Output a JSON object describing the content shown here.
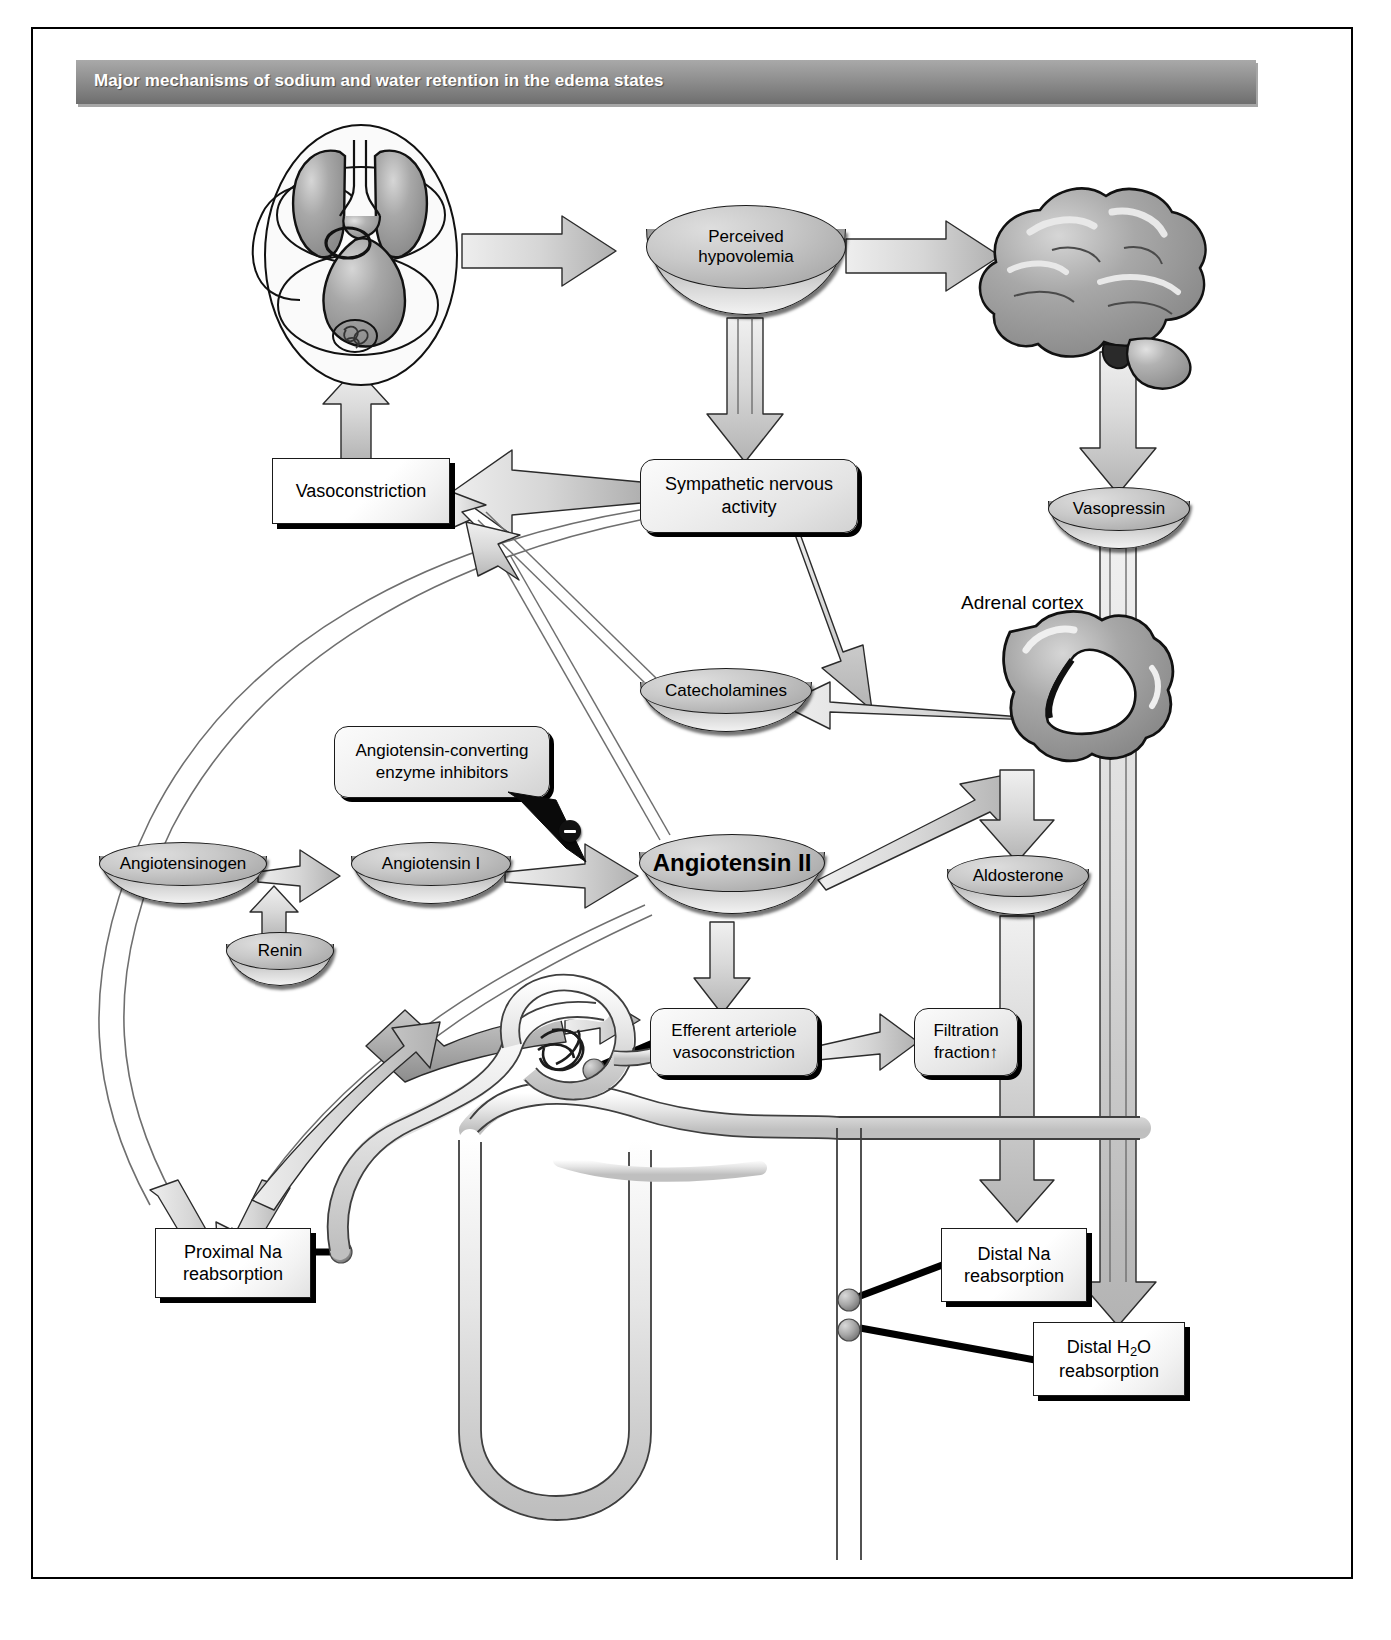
{
  "title": "Major mechanisms of sodium and water retention in the edema states",
  "diagram": {
    "type": "flowchart",
    "nodes": {
      "perceived_hypovolemia": {
        "line1": "Perceived",
        "line2": "hypovolemia",
        "shape": "disc"
      },
      "vasoconstriction": {
        "label": "Vasoconstriction",
        "shape": "rect"
      },
      "sympathetic_nervous_activity": {
        "line1": "Sympathetic nervous",
        "line2": "activity",
        "shape": "rounded-rect"
      },
      "vasopressin": {
        "label": "Vasopressin",
        "shape": "disc"
      },
      "adrenal_cortex": {
        "label": "Adrenal cortex",
        "shape": "plain-text"
      },
      "catecholamines": {
        "label": "Catecholamines",
        "shape": "disc"
      },
      "ace_inhibitors": {
        "line1": "Angiotensin-converting",
        "line2": "enzyme inhibitors",
        "shape": "callout"
      },
      "angiotensinogen": {
        "label": "Angiotensinogen",
        "shape": "disc"
      },
      "angiotensin_i": {
        "label": "Angiotensin I",
        "shape": "disc"
      },
      "angiotensin_ii": {
        "label": "Angiotensin II",
        "shape": "disc",
        "emphasis": "bold"
      },
      "aldosterone": {
        "label": "Aldosterone",
        "shape": "disc"
      },
      "renin": {
        "label": "Renin",
        "shape": "disc"
      },
      "efferent_arteriole_vasoconstriction": {
        "line1": "Efferent arteriole",
        "line2": "vasoconstriction",
        "shape": "rounded-rect"
      },
      "filtration_fraction": {
        "line1": "Filtration",
        "line2": "fraction↑",
        "shape": "rounded-rect"
      },
      "proximal_na_reabsorption": {
        "line1": "Proximal Na",
        "line2": "reabsorption",
        "shape": "rect"
      },
      "distal_na_reabsorption": {
        "line1": "Distal Na",
        "line2": "reabsorption",
        "shape": "rect"
      },
      "distal_h2o_reabsorption": {
        "line1_pre": "Distal H",
        "line1_sub": "2",
        "line1_post": "O",
        "line2": "reabsorption",
        "shape": "rect"
      }
    },
    "illustrations": {
      "heart_lungs": "heart-and-lungs-circulation-illustration",
      "brain": "brain-illustration",
      "adrenal_gland": "adrenal-cortex-illustration",
      "nephron": "nephron-tubule-and-glomerulus-illustration"
    },
    "symbols": {
      "inhibition": "⊖",
      "inhibition_name": "minus-inhibition-symbol"
    },
    "edges": [
      {
        "from": "heart_lungs",
        "to": "perceived_hypovolemia",
        "style": "block-arrow"
      },
      {
        "from": "perceived_hypovolemia",
        "to": "brain",
        "style": "block-arrow"
      },
      {
        "from": "perceived_hypovolemia",
        "to": "sympathetic_nervous_activity",
        "style": "block-arrow"
      },
      {
        "from": "brain",
        "to": "vasopressin",
        "style": "block-arrow"
      },
      {
        "from": "sympathetic_nervous_activity",
        "to": "vasoconstriction",
        "style": "block-arrow"
      },
      {
        "from": "sympathetic_nervous_activity",
        "to": "adrenal_gland",
        "style": "block-arrow"
      },
      {
        "from": "sympathetic_nervous_activity",
        "to": "renin",
        "style": "block-arrow"
      },
      {
        "from": "adrenal_gland",
        "to": "catecholamines",
        "style": "block-arrow"
      },
      {
        "from": "catecholamines",
        "to": "vasoconstriction",
        "style": "block-arrow"
      },
      {
        "from": "angiotensinogen",
        "to": "angiotensin_i",
        "style": "block-arrow"
      },
      {
        "from": "angiotensin_i",
        "to": "angiotensin_ii",
        "style": "block-arrow"
      },
      {
        "from": "ace_inhibitors",
        "to": "angiotensin_i_to_ii",
        "style": "inhibition"
      },
      {
        "from": "angiotensin_ii",
        "to": "vasoconstriction",
        "style": "block-arrow"
      },
      {
        "from": "angiotensin_ii",
        "to": "aldosterone_path",
        "style": "block-arrow"
      },
      {
        "from": "adrenal_gland",
        "to": "aldosterone",
        "style": "block-arrow"
      },
      {
        "from": "angiotensin_ii",
        "to": "efferent_arteriole_vasoconstriction",
        "style": "block-arrow"
      },
      {
        "from": "efferent_arteriole_vasoconstriction",
        "to": "filtration_fraction",
        "style": "block-arrow"
      },
      {
        "from": "angiotensin_ii",
        "to": "proximal_na_reabsorption",
        "style": "block-arrow"
      },
      {
        "from": "filtration_fraction",
        "to": "proximal_na_reabsorption",
        "style": "block-arrow"
      },
      {
        "from": "nephron_macula_densa",
        "to": "renin",
        "style": "block-arrow"
      },
      {
        "from": "aldosterone",
        "to": "distal_na_reabsorption",
        "style": "block-arrow"
      },
      {
        "from": "vasopressin",
        "to": "distal_h2o_reabsorption",
        "style": "block-arrow"
      },
      {
        "from": "angiotensinogen_loop",
        "to": "proximal_na_reabsorption",
        "style": "block-arrow"
      }
    ]
  }
}
